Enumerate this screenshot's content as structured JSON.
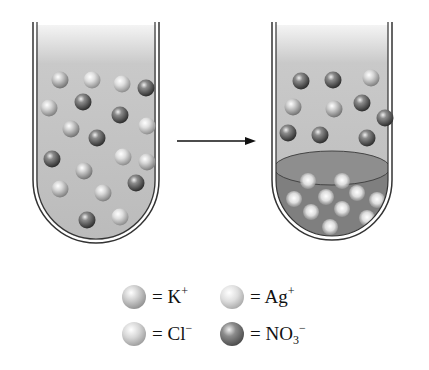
{
  "figure": {
    "arrow": {
      "direction": "right"
    }
  },
  "colors": {
    "solution": "#bdbdbd",
    "solution_top": "#f2f2f2",
    "precipitate": "#7a7a7a",
    "glass": "#333333",
    "K": "#a9a9a9",
    "Ag": "#bcbcbc",
    "Cl": "#b2b2b2",
    "NO3": "#555555"
  },
  "tubes": [
    {
      "id": "before",
      "label": "Before mixing",
      "ions": [
        {
          "species": "K",
          "x": 60,
          "y": 80
        },
        {
          "species": "Ag",
          "x": 92,
          "y": 80
        },
        {
          "species": "Ag",
          "x": 122,
          "y": 84
        },
        {
          "species": "NO3",
          "x": 146,
          "y": 88
        },
        {
          "species": "NO3",
          "x": 83,
          "y": 102
        },
        {
          "species": "Cl",
          "x": 49,
          "y": 108
        },
        {
          "species": "NO3",
          "x": 120,
          "y": 115
        },
        {
          "species": "Ag",
          "x": 147,
          "y": 126
        },
        {
          "species": "K",
          "x": 71,
          "y": 129
        },
        {
          "species": "NO3",
          "x": 97,
          "y": 138
        },
        {
          "species": "NO3",
          "x": 52,
          "y": 159
        },
        {
          "species": "Ag",
          "x": 123,
          "y": 157
        },
        {
          "species": "Cl",
          "x": 147,
          "y": 162
        },
        {
          "species": "K",
          "x": 84,
          "y": 171
        },
        {
          "species": "Cl",
          "x": 60,
          "y": 189
        },
        {
          "species": "NO3",
          "x": 136,
          "y": 183
        },
        {
          "species": "Cl",
          "x": 103,
          "y": 193
        },
        {
          "species": "NO3",
          "x": 87,
          "y": 220
        },
        {
          "species": "Ag",
          "x": 120,
          "y": 217
        }
      ]
    },
    {
      "id": "after",
      "label": "After mixing",
      "ions": [
        {
          "species": "NO3",
          "x": 301,
          "y": 81
        },
        {
          "species": "NO3",
          "x": 333,
          "y": 80
        },
        {
          "species": "Cl",
          "x": 371,
          "y": 78
        },
        {
          "species": "K",
          "x": 293,
          "y": 107
        },
        {
          "species": "K",
          "x": 334,
          "y": 109
        },
        {
          "species": "NO3",
          "x": 362,
          "y": 103
        },
        {
          "species": "NO3",
          "x": 385,
          "y": 118
        },
        {
          "species": "NO3",
          "x": 288,
          "y": 133
        },
        {
          "species": "NO3",
          "x": 320,
          "y": 135
        },
        {
          "species": "NO3",
          "x": 367,
          "y": 138
        }
      ],
      "precipitate": {
        "particles": [
          {
            "x": 308,
            "y": 181
          },
          {
            "x": 342,
            "y": 181
          },
          {
            "x": 294,
            "y": 199
          },
          {
            "x": 326,
            "y": 197
          },
          {
            "x": 357,
            "y": 193
          },
          {
            "x": 377,
            "y": 200
          },
          {
            "x": 311,
            "y": 212
          },
          {
            "x": 342,
            "y": 209
          },
          {
            "x": 367,
            "y": 218
          },
          {
            "x": 330,
            "y": 227
          }
        ]
      }
    }
  ],
  "legend": [
    {
      "species": "K",
      "label": "= K",
      "sup": "+",
      "sub": "",
      "sup2": ""
    },
    {
      "species": "Ag",
      "label": "= Ag",
      "sup": "+",
      "sub": "",
      "sup2": ""
    },
    {
      "species": "Cl",
      "label": "= Cl",
      "sup": "−",
      "sub": "",
      "sup2": ""
    },
    {
      "species": "NO3",
      "label": "= NO",
      "sup": "",
      "sub": "3",
      "sup2": "−"
    }
  ]
}
